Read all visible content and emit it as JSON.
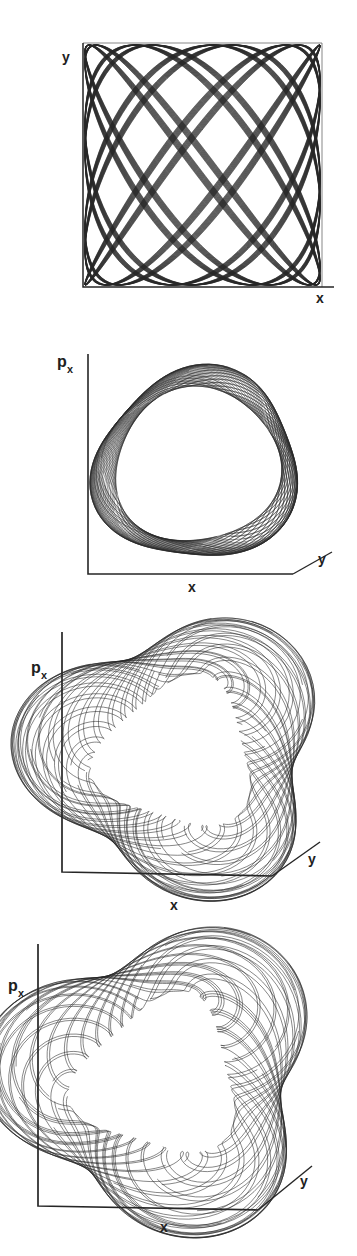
{
  "document": {
    "kind": "scientific-figure",
    "panel_count": 4,
    "background_color": "#ffffff",
    "ink_color": "#262626"
  },
  "panels": [
    {
      "id": "panel-a",
      "projection": "2d",
      "frame": "box",
      "labels": {
        "vertical": "y",
        "horizontal": "x",
        "depth": ""
      },
      "curve": {
        "kind": "lissajous",
        "description": "dense quasi-periodic x-y trajectory filling a square billiard region",
        "omega_x": 7.0,
        "omega_y": 9.0,
        "phase": 0.0,
        "turns": 34,
        "samples": 5200
      }
    },
    {
      "id": "panel-b",
      "projection": "3d",
      "frame": "axes-corner",
      "labels": {
        "vertical": "p",
        "vertical_sub": "x",
        "horizontal": "x",
        "depth": "y"
      },
      "curve": {
        "kind": "torus-winding",
        "description": "near-circular invariant torus, thin braided band, winding tightly",
        "windings": 46,
        "minor_radius": 0.105,
        "triangularity": 0.04,
        "samples": 6000
      }
    },
    {
      "id": "panel-c",
      "projection": "3d",
      "frame": "axes-corner",
      "labels": {
        "vertical": "p",
        "vertical_sub": "x",
        "horizontal": "x",
        "depth": "y"
      },
      "curve": {
        "kind": "torus-winding",
        "description": "triangular deformed torus, broad ribbon, resonant 3:1 structure",
        "windings": 31,
        "minor_radius": 0.3,
        "triangularity": 0.3,
        "samples": 6000
      }
    },
    {
      "id": "panel-d",
      "projection": "3d",
      "frame": "axes-corner",
      "labels": {
        "vertical": "p",
        "vertical_sub": "x",
        "horizontal": "x",
        "depth": "y"
      },
      "curve": {
        "kind": "torus-winding",
        "description": "triangular deformed torus, broad ribbon, slightly wider than panel c",
        "windings": 30,
        "minor_radius": 0.315,
        "triangularity": 0.32,
        "samples": 6000
      }
    }
  ],
  "chart_data": {
    "type": "line",
    "title": "",
    "xlabel": "x",
    "ylabel": "y",
    "zlabel": "p_x",
    "grid": false,
    "legend": "none",
    "series": [
      {
        "name": "panel-a x-y trajectory",
        "axes": [
          "x",
          "y"
        ],
        "points_estimated": 5200
      },
      {
        "name": "panel-b torus (x, y, p_x)",
        "axes": [
          "x",
          "y",
          "p_x"
        ],
        "points_estimated": 6000
      },
      {
        "name": "panel-c torus (x, y, p_x)",
        "axes": [
          "x",
          "y",
          "p_x"
        ],
        "points_estimated": 6000
      },
      {
        "name": "panel-d torus (x, y, p_x)",
        "axes": [
          "x",
          "y",
          "p_x"
        ],
        "points_estimated": 6000
      }
    ]
  }
}
